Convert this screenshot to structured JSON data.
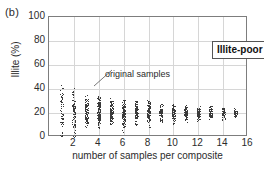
{
  "panel": {
    "label": "(b)"
  },
  "site_label": {
    "text": "Illite-poor site"
  },
  "annotation": {
    "text": "original samples"
  },
  "chart_data": {
    "type": "scatter",
    "title": "",
    "subtitle": "",
    "xlabel": "number of samples per composite",
    "ylabel": "Illite (%)",
    "xlim": [
      0,
      16
    ],
    "ylim": [
      0,
      100
    ],
    "xticks": [
      2,
      4,
      6,
      8,
      10,
      12,
      14,
      16
    ],
    "yticks": [
      0,
      20,
      40,
      60,
      80,
      100
    ],
    "grid": true,
    "legend_position": "none",
    "annotations": [
      {
        "text": "original samples",
        "points_to_x": 1,
        "points_to_y": 58
      }
    ],
    "series": [
      {
        "name": "composite illite values",
        "description": "Vertical strip of composite-average illite percentages at each composite size; spread narrows and converges toward ~20% as the number of samples per composite increases.",
        "x": [
          1,
          2,
          3,
          4,
          5,
          6,
          7,
          8,
          9,
          10,
          11,
          12,
          13,
          14,
          15
        ],
        "ymin": [
          0,
          0,
          3,
          2,
          4,
          3,
          7,
          6,
          9,
          10,
          11,
          12,
          12,
          13,
          14
        ],
        "ymax": [
          57,
          50,
          37,
          40,
          36,
          31,
          30,
          31,
          29,
          29,
          28,
          27,
          27,
          25,
          25
        ],
        "ymedian": [
          20,
          20,
          21,
          21,
          20,
          20,
          21,
          21,
          20,
          20,
          20,
          20,
          20,
          20,
          20
        ],
        "n_points": [
          60,
          90,
          110,
          130,
          120,
          110,
          100,
          95,
          85,
          85,
          80,
          75,
          70,
          55,
          45
        ]
      }
    ]
  }
}
